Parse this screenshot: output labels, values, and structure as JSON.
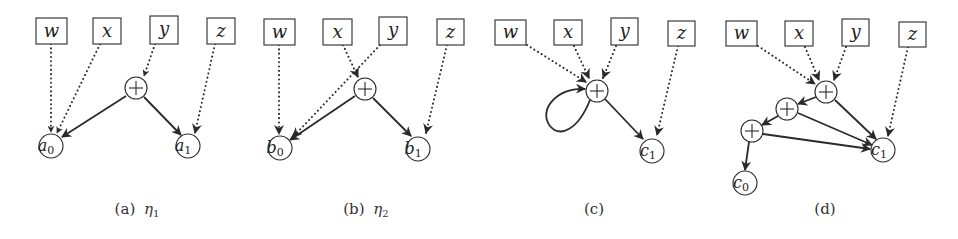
{
  "figure": {
    "panels": [
      {
        "id": "a",
        "caption_label": "(a)",
        "caption_symbol": "η",
        "caption_sub": "1",
        "inputs": [
          "w",
          "x",
          "y",
          "z"
        ],
        "sum_nodes": 1,
        "outputs": [
          {
            "name": "a",
            "sub": "0"
          },
          {
            "name": "a",
            "sub": "1"
          }
        ],
        "edges": [
          {
            "from": "w",
            "to": "a0",
            "style": "dotted"
          },
          {
            "from": "x",
            "to": "a0",
            "style": "dotted"
          },
          {
            "from": "y",
            "to": "plus",
            "style": "dotted"
          },
          {
            "from": "z",
            "to": "a1",
            "style": "dotted"
          },
          {
            "from": "plus",
            "to": "a0",
            "style": "solid"
          },
          {
            "from": "plus",
            "to": "a1",
            "style": "solid"
          }
        ]
      },
      {
        "id": "b",
        "caption_label": "(b)",
        "caption_symbol": "η",
        "caption_sub": "2",
        "inputs": [
          "w",
          "x",
          "y",
          "z"
        ],
        "sum_nodes": 1,
        "outputs": [
          {
            "name": "b",
            "sub": "0"
          },
          {
            "name": "b",
            "sub": "1"
          }
        ],
        "edges": [
          {
            "from": "w",
            "to": "b0",
            "style": "dotted"
          },
          {
            "from": "x",
            "to": "plus",
            "style": "dotted"
          },
          {
            "from": "y",
            "to": "b0",
            "style": "dotted"
          },
          {
            "from": "z",
            "to": "b1",
            "style": "dotted"
          },
          {
            "from": "plus",
            "to": "b0",
            "style": "solid"
          },
          {
            "from": "plus",
            "to": "b1",
            "style": "solid"
          }
        ]
      },
      {
        "id": "c",
        "caption_label": "(c)",
        "inputs": [
          "w",
          "x",
          "y",
          "z"
        ],
        "sum_nodes": 1,
        "outputs": [
          {
            "name": "c",
            "sub": "1"
          }
        ],
        "edges": [
          {
            "from": "w",
            "to": "plus",
            "style": "dotted"
          },
          {
            "from": "x",
            "to": "plus",
            "style": "dotted"
          },
          {
            "from": "y",
            "to": "plus",
            "style": "dotted"
          },
          {
            "from": "z",
            "to": "c1",
            "style": "dotted"
          },
          {
            "from": "plus",
            "to": "plus",
            "style": "solid-loop"
          },
          {
            "from": "plus",
            "to": "c1",
            "style": "solid"
          }
        ]
      },
      {
        "id": "d",
        "caption_label": "(d)",
        "inputs": [
          "w",
          "x",
          "y",
          "z"
        ],
        "sum_nodes": 3,
        "outputs": [
          {
            "name": "c",
            "sub": "0"
          },
          {
            "name": "c",
            "sub": "1"
          }
        ],
        "edges": [
          {
            "from": "w",
            "to": "plus1",
            "style": "dotted"
          },
          {
            "from": "x",
            "to": "plus1",
            "style": "dotted"
          },
          {
            "from": "y",
            "to": "plus1",
            "style": "dotted"
          },
          {
            "from": "z",
            "to": "c1",
            "style": "dotted"
          },
          {
            "from": "plus1",
            "to": "plus2",
            "style": "solid"
          },
          {
            "from": "plus2",
            "to": "plus3",
            "style": "solid"
          },
          {
            "from": "plus1",
            "to": "c1",
            "style": "solid"
          },
          {
            "from": "plus2",
            "to": "c1",
            "style": "solid"
          },
          {
            "from": "plus3",
            "to": "c1",
            "style": "solid"
          },
          {
            "from": "plus3",
            "to": "c0",
            "style": "solid"
          }
        ]
      }
    ],
    "plus_symbol": "+",
    "colors": {
      "stroke": "#2a2a2a",
      "text": "#222222",
      "background": "#ffffff"
    }
  }
}
